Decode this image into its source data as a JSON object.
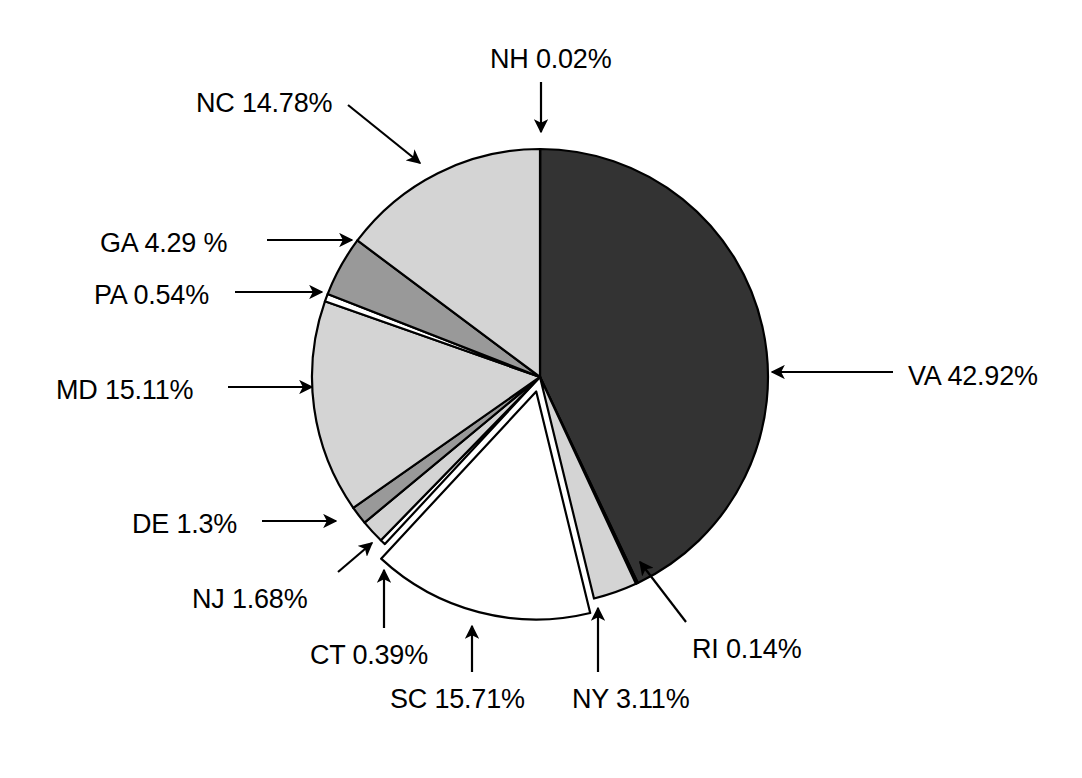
{
  "chart_data": {
    "type": "pie",
    "title": "",
    "subtitle": "",
    "xlabel": "",
    "ylabel": "",
    "legend_position": "none",
    "grid": false,
    "labels_show_percent": true,
    "units": "percent",
    "total": 99.99,
    "categories": [
      "NH",
      "VA",
      "RI",
      "NY",
      "SC",
      "CT",
      "NJ",
      "DE",
      "MD",
      "PA",
      "GA",
      "NC"
    ],
    "values": [
      0.02,
      42.92,
      0.14,
      3.11,
      15.71,
      0.39,
      1.68,
      1.3,
      15.11,
      0.54,
      4.29,
      14.78
    ],
    "slices": [
      {
        "key": "nh",
        "name": "NH",
        "value": 0.02,
        "label": "NH 0.02%",
        "color": "#333333",
        "exploded": false,
        "leader": "arrow-down",
        "label_x": 490,
        "label_y": 44
      },
      {
        "key": "va",
        "name": "VA",
        "value": 42.92,
        "label": "VA 42.92%",
        "color": "#333333",
        "exploded": false,
        "leader": "arrow-left",
        "label_x": 908,
        "label_y": 361
      },
      {
        "key": "ri",
        "name": "RI",
        "value": 0.14,
        "label": "RI 0.14%",
        "color": "#ffffff",
        "exploded": false,
        "leader": "arrow-up-left",
        "label_x": 692,
        "label_y": 634
      },
      {
        "key": "ny",
        "name": "NY",
        "value": 3.11,
        "label": "NY 3.11%",
        "color": "#d4d4d4",
        "exploded": false,
        "leader": "arrow-up",
        "label_x": 572,
        "label_y": 684
      },
      {
        "key": "sc",
        "name": "SC",
        "value": 15.71,
        "label": "SC 15.71%",
        "color": "#ffffff",
        "exploded": true,
        "leader": "arrow-up",
        "label_x": 390,
        "label_y": 684
      },
      {
        "key": "ct",
        "name": "CT",
        "value": 0.39,
        "label": "CT 0.39%",
        "color": "#ffffff",
        "exploded": false,
        "leader": "arrow-up",
        "label_x": 310,
        "label_y": 640
      },
      {
        "key": "nj",
        "name": "NJ",
        "value": 1.68,
        "label": "NJ 1.68%",
        "color": "#d4d4d4",
        "exploded": false,
        "leader": "arrow-up-right",
        "label_x": 192,
        "label_y": 584
      },
      {
        "key": "de",
        "name": "DE",
        "value": 1.3,
        "label": "DE 1.3%",
        "color": "#999999",
        "exploded": false,
        "leader": "arrow-right",
        "label_x": 132,
        "label_y": 509
      },
      {
        "key": "md",
        "name": "MD",
        "value": 15.11,
        "label": "MD 15.11%",
        "color": "#d4d4d4",
        "exploded": false,
        "leader": "arrow-right",
        "label_x": 56,
        "label_y": 375
      },
      {
        "key": "pa",
        "name": "PA",
        "value": 0.54,
        "label": "PA 0.54%",
        "color": "#ffffff",
        "exploded": false,
        "leader": "arrow-right",
        "label_x": 94,
        "label_y": 280
      },
      {
        "key": "ga",
        "name": "GA",
        "value": 4.29,
        "label": "GA 4.29 %",
        "color": "#999999",
        "exploded": false,
        "leader": "arrow-right",
        "label_x": 100,
        "label_y": 228
      },
      {
        "key": "nc",
        "name": "NC",
        "value": 14.78,
        "label": "NC 14.78%",
        "color": "#d4d4d4",
        "exploded": false,
        "leader": "arrow-down-right",
        "label_x": 196,
        "label_y": 88
      }
    ],
    "colors": {
      "dark": "#333333",
      "medium_gray": "#999999",
      "light_gray": "#d4d4d4",
      "white": "#ffffff",
      "outline": "#000000",
      "background": "#ffffff"
    },
    "geometry": {
      "center_x": 540,
      "center_y": 377,
      "radius": 228,
      "start_angle_deg": 0,
      "direction": "clockwise"
    }
  }
}
